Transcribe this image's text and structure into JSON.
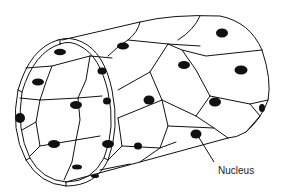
{
  "diagram": {
    "labels": [
      {
        "id": "nucleus",
        "text": "Nucleus",
        "x": 228,
        "y": 166
      }
    ],
    "colors": {
      "line": "#111111",
      "nucleus_fill": "#111111",
      "background": "#ffffff",
      "label_text": "#222222"
    }
  }
}
